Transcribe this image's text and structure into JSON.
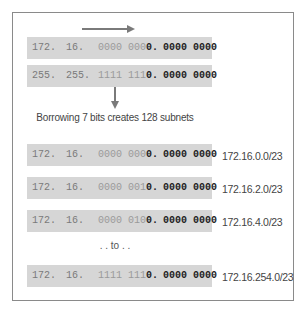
{
  "top": {
    "address": {
      "o1": "172.",
      "o2": "16.",
      "o3_host": "0000 000",
      "o3_bit": "0.",
      "o4": "0000 0000"
    },
    "mask": {
      "o1": "255.",
      "o2": "255.",
      "o3_host": "1111 111",
      "o3_bit": "0.",
      "o4": "0000 0000"
    }
  },
  "caption": "Borrowing 7 bits creates 128 subnets",
  "separator": ". . to . .",
  "subnets": [
    {
      "o1": "172.",
      "o2": "16.",
      "o3_host": "0000 000",
      "o3_bit": "0.",
      "o4": "0000 0000",
      "label": "172.16.0.0/23"
    },
    {
      "o1": "172.",
      "o2": "16.",
      "o3_host": "0000 001",
      "o3_bit": "0.",
      "o4": "0000 0000",
      "label": "172.16.2.0/23"
    },
    {
      "o1": "172.",
      "o2": "16.",
      "o3_host": "0000 010",
      "o3_bit": "0.",
      "o4": "0000 0000",
      "label": "172.16.4.0/23"
    },
    {
      "o1": "172.",
      "o2": "16.",
      "o3_host": "1111 111",
      "o3_bit": "0.",
      "o4": "0000 0000",
      "label": "172.16.254.0/23"
    }
  ],
  "colors": {
    "row_bg": "#d6d6d6",
    "arrow": "#7a7a7a",
    "frame": "#8a8a8a"
  }
}
